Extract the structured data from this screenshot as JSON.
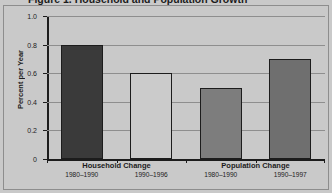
{
  "figure": {
    "background_color": "#c9c9c9",
    "frame_color": "#8d8d8d",
    "axis_color": "#1c1c1c",
    "grid_color": "#8e8e8e"
  },
  "chart_data": {
    "type": "bar",
    "title": "Figure 1. Household and Population Growth",
    "xlabel": "",
    "ylabel": "Percent per Year",
    "ylim": [
      0,
      1.0
    ],
    "yticks": [
      "0",
      "0.2",
      "0.4",
      "0.6",
      "0.8",
      "1.0"
    ],
    "ytick_values": [
      0,
      0.2,
      0.4,
      0.6,
      0.8,
      1.0
    ],
    "grid": true,
    "legend": "none",
    "categories": [
      "1980–1990",
      "1990–1996",
      "1980–1990",
      "1990–1997"
    ],
    "values": [
      0.8,
      0.6,
      0.5,
      0.7
    ],
    "bar_colors": [
      "#3a3a3a",
      "#cbcbcb",
      "#7d7d7d",
      "#6f6f6f"
    ],
    "groups": [
      {
        "label": "Household Change",
        "bars": [
          {
            "period": "1980–1990",
            "value": 0.8,
            "color": "#3a3a3a"
          },
          {
            "period": "1990–1996",
            "value": 0.6,
            "color": "#cbcbcb"
          }
        ]
      },
      {
        "label": "Population Change",
        "bars": [
          {
            "period": "1980–1990",
            "value": 0.5,
            "color": "#7d7d7d"
          },
          {
            "period": "1990–1997",
            "value": 0.7,
            "color": "#6f6f6f"
          }
        ]
      }
    ]
  }
}
